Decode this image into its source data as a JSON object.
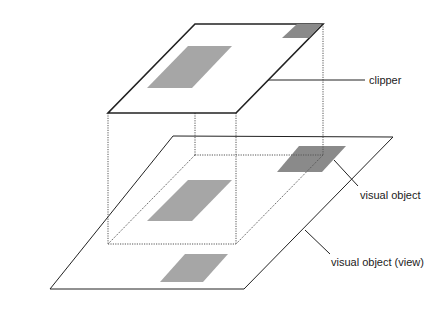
{
  "diagram": {
    "labels": {
      "clipper": "clipper",
      "visual_object": "visual object",
      "visual_object_view": "visual object (view)"
    },
    "colors": {
      "line": "#222222",
      "dotted": "#555555",
      "shade_light": "#a6a6a6",
      "shade_dark": "#8a8a8a",
      "background": "#ffffff"
    },
    "layers": [
      {
        "name": "clipper",
        "type": "plane",
        "position": "top"
      },
      {
        "name": "visual object (view)",
        "type": "plane",
        "position": "bottom"
      },
      {
        "name": "visual object",
        "type": "shaded-region",
        "position": "bottom-plane-back-right"
      }
    ]
  }
}
